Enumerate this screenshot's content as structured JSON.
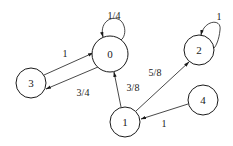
{
  "diagram": {
    "type": "markov-chain",
    "nodes": [
      {
        "id": "0",
        "label": "0",
        "cx": 110,
        "cy": 54,
        "r": 18
      },
      {
        "id": "1",
        "label": "1",
        "cx": 125,
        "cy": 122,
        "r": 15
      },
      {
        "id": "2",
        "label": "2",
        "cx": 199,
        "cy": 50,
        "r": 15
      },
      {
        "id": "3",
        "label": "3",
        "cx": 31,
        "cy": 83,
        "r": 15
      },
      {
        "id": "4",
        "label": "4",
        "cx": 203,
        "cy": 100,
        "r": 15
      }
    ],
    "edges": [
      {
        "from": "0",
        "to": "0",
        "label": "1/4"
      },
      {
        "from": "3",
        "to": "0",
        "label": "1"
      },
      {
        "from": "0",
        "to": "3",
        "label": "3/4"
      },
      {
        "from": "1",
        "to": "0",
        "label": "3/8"
      },
      {
        "from": "1",
        "to": "2",
        "label": "5/8"
      },
      {
        "from": "2",
        "to": "2",
        "label": "1"
      },
      {
        "from": "4",
        "to": "1",
        "label": "1"
      }
    ]
  }
}
